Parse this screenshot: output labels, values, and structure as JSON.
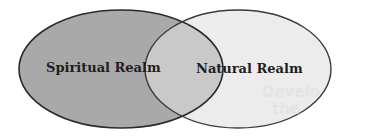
{
  "diagram": {
    "type": "venn",
    "sets": [
      {
        "label": "Spiritual Realm",
        "fill": "#a9a9a9"
      },
      {
        "label": "Natural Realm",
        "fill": "#ececec"
      }
    ],
    "overlap_fill": "#c9c9c9",
    "stroke": "#2a2a2a",
    "ghost_text": [
      "Develo",
      "the"
    ]
  }
}
